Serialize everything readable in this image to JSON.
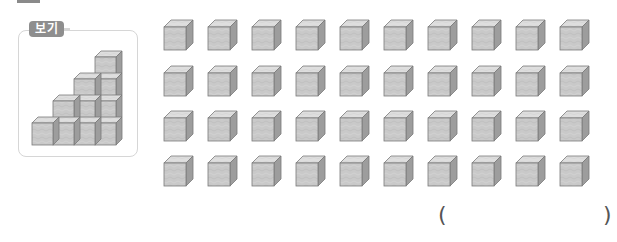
{
  "example": {
    "label": "보기",
    "staircase": {
      "columns": [
        1,
        2,
        3,
        4
      ],
      "description": "staircase of stacked cubes, column heights 1,2,3,4"
    }
  },
  "cube_grid": {
    "rows": 4,
    "columns": 10,
    "total": 40
  },
  "answer": {
    "open_paren": "(",
    "close_paren": ")",
    "value": ""
  },
  "colors": {
    "front": "#c9c9c9",
    "top": "#dedede",
    "side": "#9d9d9d",
    "edge": "#7a7a7a",
    "label_bg": "#8e8e8e",
    "box_border": "#d6d6d6"
  }
}
